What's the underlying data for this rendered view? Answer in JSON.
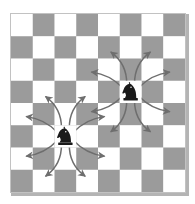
{
  "figure": {
    "width": 195,
    "height": 204
  },
  "colors": {
    "light_square": "#ffffff",
    "dark_square": "#9b9b9b",
    "board_border": "#c2c2c2",
    "board_shadow": "#b4b4b4",
    "arrow": "#6e6e6e",
    "piece_body": "#1a1a1a",
    "piece_outline": "#000000",
    "background": "#ffffff"
  },
  "board": {
    "files": 8,
    "ranks": 8,
    "origin_x": 11,
    "origin_y": 14,
    "square_width": 21.75,
    "square_height": 22.25,
    "light_first": true,
    "top_left_square_color": "light"
  },
  "pieces": [
    {
      "type": "knight",
      "color": "black",
      "glyph": "♞",
      "col": 2,
      "row": 5,
      "name": "knight-lower-left"
    },
    {
      "type": "knight",
      "color": "black",
      "glyph": "♞",
      "col": 5,
      "row": 3,
      "name": "knight-upper-right"
    }
  ],
  "moves": {
    "offsets": [
      {
        "dc": 1,
        "dr": -2
      },
      {
        "dc": 2,
        "dr": -1
      },
      {
        "dc": 2,
        "dr": 1
      },
      {
        "dc": 1,
        "dr": 2
      },
      {
        "dc": -1,
        "dr": 2
      },
      {
        "dc": -2,
        "dr": 1
      },
      {
        "dc": -2,
        "dr": -1
      },
      {
        "dc": -1,
        "dr": -2
      }
    ],
    "count_per_knight": 8,
    "style": "curved-arrow",
    "arrowhead": true
  },
  "chart_data": {
    "type": "diagram",
    "board_size": "8x8",
    "knights": [
      {
        "col": 2,
        "row": 5,
        "moves": 8
      },
      {
        "col": 5,
        "row": 3,
        "moves": 8
      }
    ]
  }
}
